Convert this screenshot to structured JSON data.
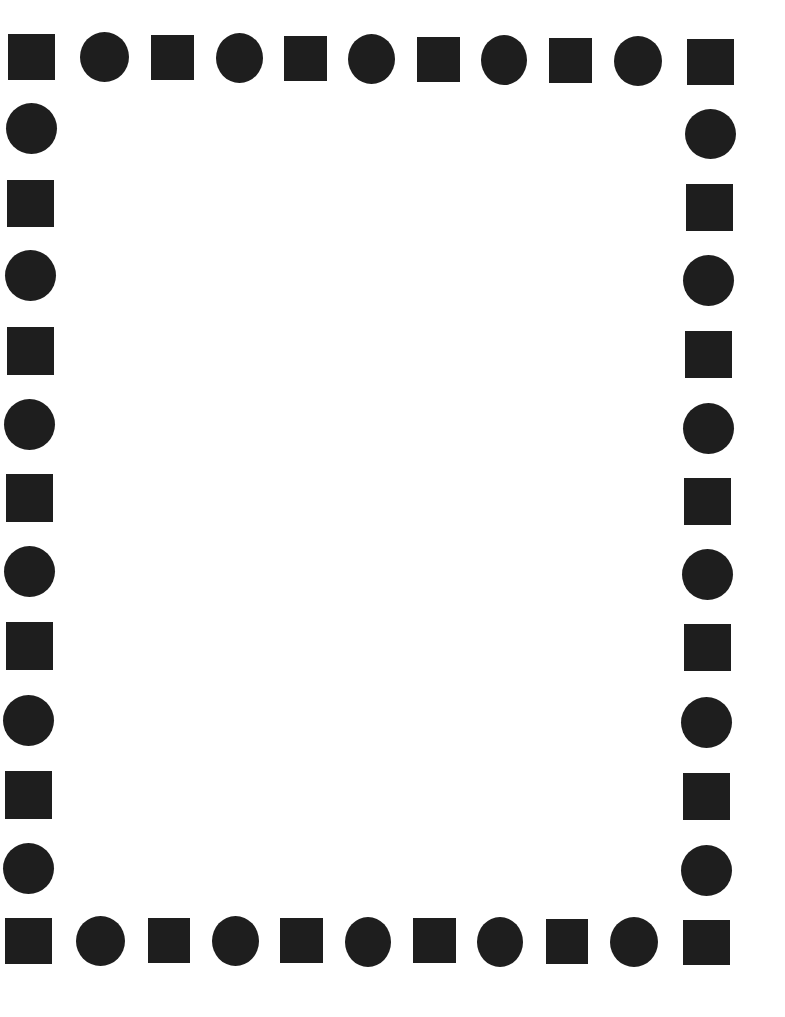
{
  "page": {
    "background_color": "#ffffff",
    "shape_color": "#1e1e1e"
  },
  "border": {
    "top": [
      {
        "type": "square",
        "x": 8,
        "y": 34,
        "w": 47,
        "h": 46
      },
      {
        "type": "circle",
        "x": 80,
        "y": 32,
        "w": 49,
        "h": 50
      },
      {
        "type": "square",
        "x": 151,
        "y": 35,
        "w": 43,
        "h": 45
      },
      {
        "type": "circle",
        "x": 216,
        "y": 33,
        "w": 47,
        "h": 50
      },
      {
        "type": "square",
        "x": 284,
        "y": 36,
        "w": 43,
        "h": 45
      },
      {
        "type": "circle",
        "x": 348,
        "y": 34,
        "w": 47,
        "h": 50
      },
      {
        "type": "square",
        "x": 417,
        "y": 37,
        "w": 43,
        "h": 45
      },
      {
        "type": "circle",
        "x": 481,
        "y": 35,
        "w": 46,
        "h": 50
      },
      {
        "type": "square",
        "x": 549,
        "y": 38,
        "w": 43,
        "h": 45
      },
      {
        "type": "circle",
        "x": 614,
        "y": 36,
        "w": 48,
        "h": 50
      },
      {
        "type": "square",
        "x": 687,
        "y": 39,
        "w": 47,
        "h": 46
      }
    ],
    "left": [
      {
        "type": "circle",
        "x": 6,
        "y": 103,
        "w": 51,
        "h": 51
      },
      {
        "type": "square",
        "x": 7,
        "y": 180,
        "w": 47,
        "h": 47
      },
      {
        "type": "circle",
        "x": 5,
        "y": 250,
        "w": 51,
        "h": 51
      },
      {
        "type": "square",
        "x": 7,
        "y": 327,
        "w": 47,
        "h": 48
      },
      {
        "type": "circle",
        "x": 4,
        "y": 399,
        "w": 51,
        "h": 51
      },
      {
        "type": "square",
        "x": 6,
        "y": 474,
        "w": 47,
        "h": 48
      },
      {
        "type": "circle",
        "x": 4,
        "y": 546,
        "w": 51,
        "h": 51
      },
      {
        "type": "square",
        "x": 6,
        "y": 622,
        "w": 47,
        "h": 48
      },
      {
        "type": "circle",
        "x": 3,
        "y": 695,
        "w": 51,
        "h": 51
      },
      {
        "type": "square",
        "x": 5,
        "y": 771,
        "w": 47,
        "h": 48
      },
      {
        "type": "circle",
        "x": 3,
        "y": 843,
        "w": 51,
        "h": 51
      }
    ],
    "right": [
      {
        "type": "circle",
        "x": 685,
        "y": 109,
        "w": 51,
        "h": 50
      },
      {
        "type": "square",
        "x": 686,
        "y": 184,
        "w": 47,
        "h": 47
      },
      {
        "type": "circle",
        "x": 683,
        "y": 255,
        "w": 51,
        "h": 51
      },
      {
        "type": "square",
        "x": 685,
        "y": 331,
        "w": 47,
        "h": 47
      },
      {
        "type": "circle",
        "x": 683,
        "y": 403,
        "w": 51,
        "h": 51
      },
      {
        "type": "square",
        "x": 684,
        "y": 478,
        "w": 47,
        "h": 47
      },
      {
        "type": "circle",
        "x": 682,
        "y": 549,
        "w": 51,
        "h": 51
      },
      {
        "type": "square",
        "x": 684,
        "y": 624,
        "w": 47,
        "h": 47
      },
      {
        "type": "circle",
        "x": 681,
        "y": 697,
        "w": 51,
        "h": 51
      },
      {
        "type": "square",
        "x": 683,
        "y": 773,
        "w": 47,
        "h": 47
      },
      {
        "type": "circle",
        "x": 681,
        "y": 845,
        "w": 51,
        "h": 51
      }
    ],
    "bottom": [
      {
        "type": "square",
        "x": 5,
        "y": 918,
        "w": 47,
        "h": 46
      },
      {
        "type": "circle",
        "x": 76,
        "y": 916,
        "w": 49,
        "h": 50
      },
      {
        "type": "square",
        "x": 148,
        "y": 918,
        "w": 42,
        "h": 45
      },
      {
        "type": "circle",
        "x": 212,
        "y": 916,
        "w": 47,
        "h": 50
      },
      {
        "type": "square",
        "x": 280,
        "y": 918,
        "w": 43,
        "h": 45
      },
      {
        "type": "circle",
        "x": 345,
        "y": 917,
        "w": 46,
        "h": 50
      },
      {
        "type": "square",
        "x": 413,
        "y": 918,
        "w": 43,
        "h": 45
      },
      {
        "type": "circle",
        "x": 477,
        "y": 917,
        "w": 46,
        "h": 50
      },
      {
        "type": "square",
        "x": 546,
        "y": 919,
        "w": 42,
        "h": 45
      },
      {
        "type": "circle",
        "x": 610,
        "y": 917,
        "w": 48,
        "h": 50
      },
      {
        "type": "square",
        "x": 683,
        "y": 920,
        "w": 47,
        "h": 45
      }
    ]
  }
}
